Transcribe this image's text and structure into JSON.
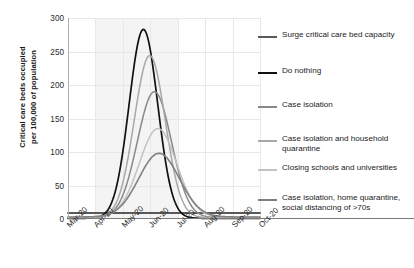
{
  "chart_data": {
    "type": "line",
    "title": "",
    "xlabel": "",
    "ylabel": "Critical care beds occupied\nper 100,000 of population",
    "ylim": [
      0,
      300
    ],
    "yticks": [
      0,
      50,
      100,
      150,
      200,
      250,
      300
    ],
    "categories": [
      "Mar-20",
      "Apr-20",
      "May-20",
      "Jun-20",
      "Jul-20",
      "Aug-20",
      "Sep-20",
      "Oct-20"
    ],
    "grid": true,
    "legend_position": "right",
    "series": [
      {
        "name": "Surge critical care bed capacity",
        "color": "#595959",
        "width": 1.9,
        "kind": "threshold",
        "value": 9,
        "peak": 9,
        "peak_month": "constant"
      },
      {
        "name": "Do nothing",
        "color": "#111111",
        "width": 1.7,
        "kind": "curve",
        "peak": 282,
        "peak_x": 2.75,
        "spread": 0.52,
        "baseline": 1
      },
      {
        "name": "Case isolation",
        "color": "#888888",
        "width": 1.5,
        "kind": "curve",
        "peak": 188,
        "peak_x": 3.15,
        "spread": 0.62,
        "baseline": 2
      },
      {
        "name": "Case isolation and household\nquarantine",
        "color": "#a8a8a8",
        "width": 1.5,
        "kind": "curve",
        "peak": 242,
        "peak_x": 2.98,
        "spread": 0.56,
        "baseline": 2
      },
      {
        "name": "Closing schools and universities",
        "color": "#c2c2c2",
        "width": 1.5,
        "kind": "curve",
        "peak": 132,
        "peak_x": 3.28,
        "spread": 0.68,
        "baseline": 3
      },
      {
        "name": "Case isolation, home quarantine,\nsocial distancing of >70s",
        "color": "#808080",
        "width": 1.6,
        "kind": "curve",
        "peak": 95,
        "peak_x": 3.32,
        "spread": 0.74,
        "baseline": 3
      }
    ]
  },
  "axis": {
    "y_title": "Critical care beds occupied\nper 100,000 of population",
    "y_ticks": [
      "300",
      "250",
      "200",
      "150",
      "100",
      "50",
      "0"
    ],
    "x_ticks": [
      "Mar-20",
      "Apr-20",
      "May-20",
      "Jun-20",
      "Jul-20",
      "Aug-20",
      "Sep-20",
      "Oct-20"
    ]
  },
  "legend": {
    "items": [
      {
        "label": "Surge critical care bed capacity"
      },
      {
        "label": "Do nothing"
      },
      {
        "label": "Case isolation"
      },
      {
        "label": "Case isolation and household\nquarantine"
      },
      {
        "label": "Closing schools and universities"
      },
      {
        "label": "Case isolation, home quarantine,\nsocial distancing of >70s"
      }
    ]
  }
}
